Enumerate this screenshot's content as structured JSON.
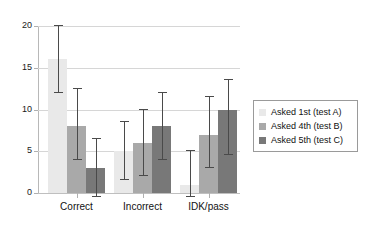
{
  "chart_data": {
    "type": "bar",
    "title": "",
    "xlabel": "",
    "ylabel": "",
    "categories": [
      "Correct",
      "Incorrect",
      "IDK/pass"
    ],
    "ylim": [
      0,
      20
    ],
    "yticks": [
      0,
      5,
      10,
      15,
      20
    ],
    "grid": true,
    "legend_position": "right",
    "series": [
      {
        "name": "Asked 1st (test A)",
        "color": "#e9e9e9",
        "values": [
          16,
          5,
          1
        ],
        "err_low": [
          12,
          1.5,
          -0.5
        ],
        "err_high": [
          20,
          8.5,
          5
        ]
      },
      {
        "name": "Asked 4th (test B)",
        "color": "#a9a9a9",
        "values": [
          8,
          6,
          7
        ],
        "err_low": [
          4,
          2,
          3
        ],
        "err_high": [
          12.5,
          10,
          11.5
        ]
      },
      {
        "name": "Asked 5th (test C)",
        "color": "#787878",
        "values": [
          3,
          8,
          10
        ],
        "err_low": [
          -0.5,
          4,
          4.5
        ],
        "err_high": [
          6.5,
          12,
          13.5
        ]
      }
    ]
  },
  "axis": {
    "y_tick_labels": [
      "0",
      "5",
      "10",
      "15",
      "20"
    ]
  },
  "legend": {
    "entries": [
      {
        "label": "Asked 1st (test A)",
        "color": "#e9e9e9"
      },
      {
        "label": "Asked 4th (test B)",
        "color": "#a9a9a9"
      },
      {
        "label": "Asked 5th (test C)",
        "color": "#787878"
      }
    ]
  }
}
